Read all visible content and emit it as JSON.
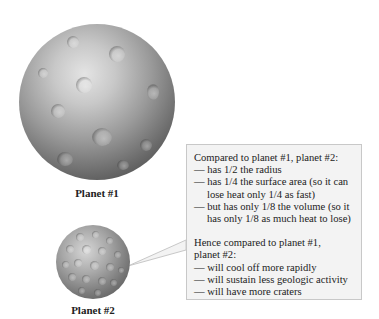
{
  "planets": [
    {
      "id": 1,
      "label": "Planet #1",
      "relative_radius": 1
    },
    {
      "id": 2,
      "label": "Planet #2",
      "relative_radius": 0.5
    }
  ],
  "callout": {
    "heading": "Compared to planet #1, planet #2:",
    "facts": [
      {
        "first": "— has 1/2 the radius",
        "cont": ""
      },
      {
        "first": "— has 1/4 the surface area (so it can",
        "cont": "lose heat only 1/4 as fast)"
      },
      {
        "first": "— but has only 1/8 the volume (so it",
        "cont": "has only 1/8 as much heat to lose)"
      }
    ],
    "conclusion_heading_1": "Hence compared to planet #1,",
    "conclusion_heading_2": "planet #2:",
    "conclusions": [
      "— will cool off more rapidly",
      "— will sustain less geologic activity",
      "— will have more craters"
    ]
  },
  "colors": {
    "box_background": "#f3f3f3",
    "box_border": "#c8c8c8",
    "planet_gray": "#9a9a9a"
  }
}
